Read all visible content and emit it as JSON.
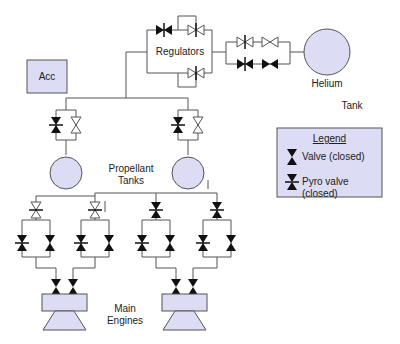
{
  "labels": {
    "regulators": "Regulators",
    "helium": "Helium",
    "tank": "Tank",
    "acc": "Acc",
    "propellant_line1": "Propellant",
    "propellant_line2": "Tanks",
    "main_line1": "Main",
    "main_line2": "Engines"
  },
  "legend": {
    "title": "Legend",
    "items": [
      {
        "symbol": "valve-closed-icon",
        "label": "Valve (closed)"
      },
      {
        "symbol": "pyro-valve-closed-icon",
        "label": "Pyro valve (closed)"
      }
    ]
  },
  "colors": {
    "fill": "#dcdcf4",
    "line": "#555555",
    "valve": "#111111"
  }
}
